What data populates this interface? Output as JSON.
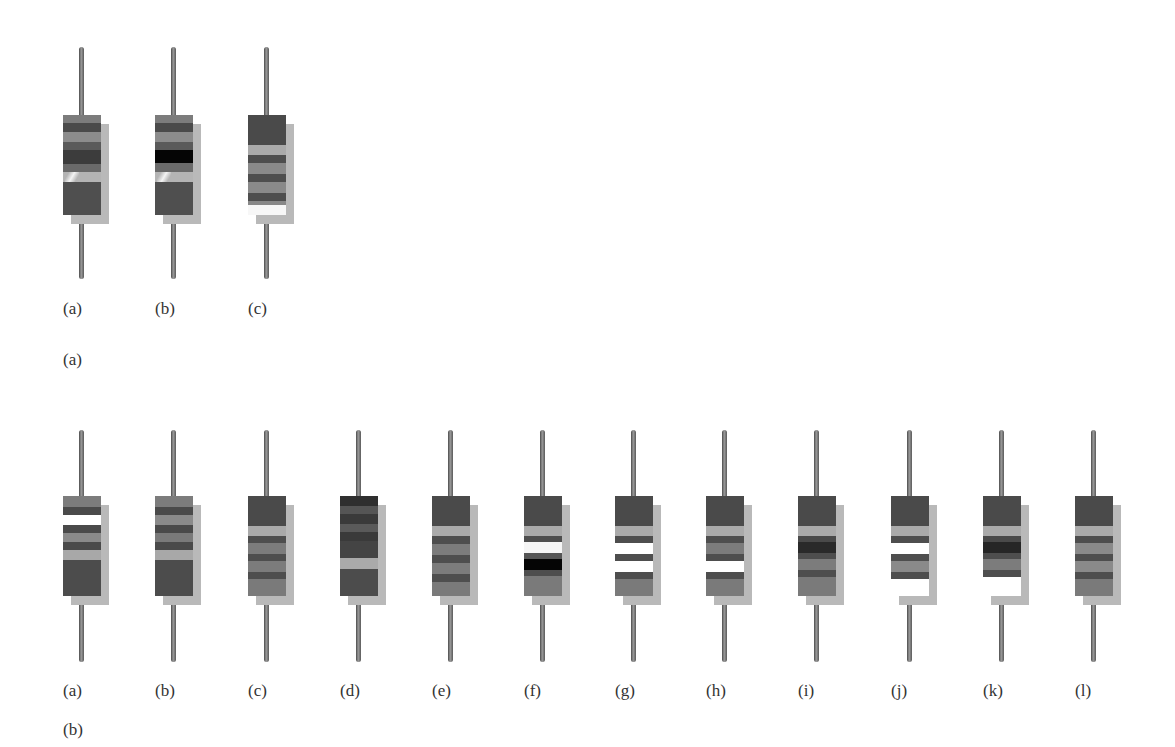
{
  "figure": {
    "panels": [
      {
        "id": "top",
        "panel_label": "(a)",
        "resistors": [
          {
            "label": "(a)",
            "bands": [
              [
                8,
                "#7c7c7c"
              ],
              [
                9,
                "#4a4a4a"
              ],
              [
                10,
                "#8c8c8c"
              ],
              [
                8,
                "#5a5a5a"
              ],
              [
                14,
                "#3c3c3c"
              ],
              [
                8,
                "#6a6a6a"
              ],
              [
                10,
                "#b4b4b4",
                "glare"
              ],
              [
                33,
                "#4f4f4f"
              ]
            ]
          },
          {
            "label": "(b)",
            "bands": [
              [
                8,
                "#7c7c7c"
              ],
              [
                9,
                "#4a4a4a"
              ],
              [
                10,
                "#8c8c8c"
              ],
              [
                8,
                "#5a5a5a"
              ],
              [
                13,
                "#050505"
              ],
              [
                9,
                "#6a6a6a"
              ],
              [
                10,
                "#b4b4b4",
                "glare"
              ],
              [
                33,
                "#4f4f4f"
              ]
            ]
          },
          {
            "label": "(c)",
            "bands": [
              [
                30,
                "#4a4a4a"
              ],
              [
                10,
                "#aaaaaa"
              ],
              [
                8,
                "#4e4e4e"
              ],
              [
                11,
                "#8a8a8a"
              ],
              [
                8,
                "#4e4e4e"
              ],
              [
                11,
                "#8a8a8a"
              ],
              [
                8,
                "#4e4e4e"
              ],
              [
                4,
                "#888888"
              ],
              [
                10,
                "#f7f7f7"
              ]
            ]
          }
        ]
      },
      {
        "id": "bottom",
        "panel_label": "(b)",
        "resistors": [
          {
            "label": "(a)",
            "bands": [
              [
                11,
                "#7c7c7c"
              ],
              [
                8,
                "#4a4a4a"
              ],
              [
                10,
                "#ffffff"
              ],
              [
                8,
                "#4a4a4a"
              ],
              [
                9,
                "#8a8a8a"
              ],
              [
                8,
                "#4a4a4a"
              ],
              [
                10,
                "#a8a8a8"
              ],
              [
                36,
                "#4c4c4c"
              ]
            ]
          },
          {
            "label": "(b)",
            "bands": [
              [
                11,
                "#7c7c7c"
              ],
              [
                8,
                "#4a4a4a"
              ],
              [
                10,
                "#8a8a8a"
              ],
              [
                8,
                "#4a4a4a"
              ],
              [
                9,
                "#7a7a7a"
              ],
              [
                8,
                "#4a4a4a"
              ],
              [
                10,
                "#a8a8a8"
              ],
              [
                36,
                "#4c4c4c"
              ]
            ]
          },
          {
            "label": "(c)",
            "bands": [
              [
                30,
                "#4a4a4a"
              ],
              [
                10,
                "#aaaaaa"
              ],
              [
                7,
                "#4e4e4e"
              ],
              [
                11,
                "#7c7c7c"
              ],
              [
                7,
                "#4e4e4e"
              ],
              [
                11,
                "#7c7c7c"
              ],
              [
                7,
                "#4e4e4e"
              ],
              [
                17,
                "#7a7a7a"
              ]
            ]
          },
          {
            "label": "(d)",
            "bands": [
              [
                10,
                "#2f2f2f"
              ],
              [
                8,
                "#555555"
              ],
              [
                10,
                "#3a3a3a"
              ],
              [
                8,
                "#5a5a5a"
              ],
              [
                9,
                "#3a3a3a"
              ],
              [
                17,
                "#444444"
              ],
              [
                11,
                "#aaaaaa"
              ],
              [
                27,
                "#4c4c4c"
              ]
            ]
          },
          {
            "label": "(e)",
            "bands": [
              [
                30,
                "#4a4a4a"
              ],
              [
                10,
                "#aaaaaa"
              ],
              [
                8,
                "#4e4e4e"
              ],
              [
                11,
                "#7c7c7c"
              ],
              [
                8,
                "#4e4e4e"
              ],
              [
                11,
                "#7c7c7c"
              ],
              [
                8,
                "#4e4e4e"
              ],
              [
                14,
                "#7a7a7a"
              ]
            ]
          },
          {
            "label": "(f)",
            "bands": [
              [
                30,
                "#4a4a4a"
              ],
              [
                10,
                "#aaaaaa"
              ],
              [
                6,
                "#4e4e4e"
              ],
              [
                11,
                "#f5f5f5"
              ],
              [
                6,
                "#555555"
              ],
              [
                11,
                "#050505"
              ],
              [
                6,
                "#4e4e4e"
              ],
              [
                20,
                "#7a7a7a"
              ]
            ]
          },
          {
            "label": "(g)",
            "bands": [
              [
                30,
                "#4a4a4a"
              ],
              [
                10,
                "#aaaaaa"
              ],
              [
                7,
                "#4e4e4e"
              ],
              [
                11,
                "#ffffff"
              ],
              [
                7,
                "#4e4e4e"
              ],
              [
                11,
                "#ffffff"
              ],
              [
                7,
                "#4e4e4e"
              ],
              [
                17,
                "#7a7a7a"
              ]
            ]
          },
          {
            "label": "(h)",
            "bands": [
              [
                30,
                "#4a4a4a"
              ],
              [
                10,
                "#aaaaaa"
              ],
              [
                7,
                "#4e4e4e"
              ],
              [
                11,
                "#7c7c7c"
              ],
              [
                7,
                "#4e4e4e"
              ],
              [
                11,
                "#ffffff"
              ],
              [
                7,
                "#4e4e4e"
              ],
              [
                17,
                "#7a7a7a"
              ]
            ]
          },
          {
            "label": "(i)",
            "bands": [
              [
                30,
                "#4a4a4a"
              ],
              [
                10,
                "#aaaaaa"
              ],
              [
                6,
                "#4a4a4a"
              ],
              [
                11,
                "#2a2a2a"
              ],
              [
                6,
                "#4e4e4e"
              ],
              [
                11,
                "#7c7c7c"
              ],
              [
                7,
                "#4e4e4e"
              ],
              [
                19,
                "#7a7a7a"
              ]
            ]
          },
          {
            "label": "(j)",
            "bands": [
              [
                30,
                "#4a4a4a"
              ],
              [
                10,
                "#aaaaaa"
              ],
              [
                7,
                "#4e4e4e"
              ],
              [
                11,
                "#ffffff"
              ],
              [
                7,
                "#4e4e4e"
              ],
              [
                11,
                "#8a8a8a"
              ],
              [
                7,
                "#4e4e4e"
              ],
              [
                17,
                "#ffffff"
              ]
            ]
          },
          {
            "label": "(k)",
            "bands": [
              [
                30,
                "#4a4a4a"
              ],
              [
                10,
                "#aaaaaa"
              ],
              [
                6,
                "#4a4a4a"
              ],
              [
                11,
                "#262626"
              ],
              [
                6,
                "#4e4e4e"
              ],
              [
                11,
                "#7c7c7c"
              ],
              [
                7,
                "#4e4e4e"
              ],
              [
                19,
                "#ffffff"
              ]
            ]
          },
          {
            "label": "(l)",
            "bands": [
              [
                30,
                "#4a4a4a"
              ],
              [
                10,
                "#aaaaaa"
              ],
              [
                7,
                "#4e4e4e"
              ],
              [
                11,
                "#8a8a8a"
              ],
              [
                7,
                "#4e4e4e"
              ],
              [
                11,
                "#8a8a8a"
              ],
              [
                7,
                "#4e4e4e"
              ],
              [
                17,
                "#7a7a7a"
              ]
            ]
          }
        ]
      }
    ]
  }
}
